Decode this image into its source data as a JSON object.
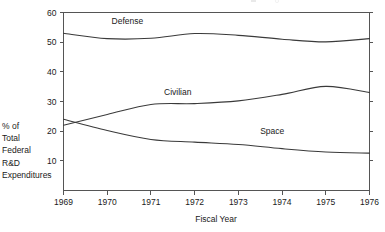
{
  "chart_data": {
    "type": "line",
    "title": "",
    "xlabel": "Fiscal Year",
    "ylabel": "% of Total Federal R&D Expenditures",
    "ylabel_lines": [
      "% of",
      "Total",
      "Federal",
      "R&D",
      "Expenditures"
    ],
    "xlim": [
      1969,
      1976
    ],
    "ylim": [
      0,
      60
    ],
    "xticks": [
      1969,
      1970,
      1971,
      1972,
      1973,
      1974,
      1975,
      1976
    ],
    "xtick_labels": [
      "1969",
      "1970",
      "1971",
      "1972",
      "1973",
      "1974",
      "1975",
      "1976"
    ],
    "yticks": [
      10,
      20,
      30,
      40,
      50,
      60
    ],
    "ytick_labels": [
      "10",
      "20",
      "30",
      "40",
      "50",
      "60"
    ],
    "grid": false,
    "legend_position": "inline-labels",
    "x": [
      1969,
      1970,
      1971,
      1972,
      1973,
      1974,
      1975,
      1976
    ],
    "series": [
      {
        "name": "Defense",
        "label": "Defense",
        "values": [
          53.0,
          51.2,
          51.3,
          52.9,
          52.3,
          51.0,
          50.1,
          51.2
        ],
        "label_x": 1970.1,
        "label_y": 56.0
      },
      {
        "name": "Civilian",
        "label": "Civilian",
        "values": [
          22.0,
          25.6,
          29.0,
          29.3,
          30.2,
          32.4,
          35.1,
          33.0
        ],
        "label_x": 1971.3,
        "label_y": 32.2
      },
      {
        "name": "Space",
        "label": "Space",
        "values": [
          24.0,
          20.2,
          17.2,
          16.3,
          15.5,
          14.1,
          13.0,
          12.6
        ],
        "label_x": 1973.5,
        "label_y": 19.0
      }
    ]
  },
  "axes": {
    "x_axis_title": "Fiscal Year",
    "y_axis_title_lines": [
      "% of",
      "Total",
      "Federal",
      "R&D",
      "Expenditures"
    ]
  }
}
